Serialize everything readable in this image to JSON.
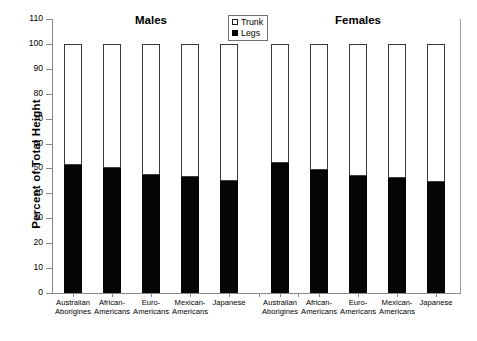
{
  "chart_data": {
    "type": "bar",
    "subtype": "stacked-percent",
    "title": "",
    "xlabel": "",
    "ylabel": "Percent of Total Height",
    "ylim": [
      0,
      110
    ],
    "ytick_step": 10,
    "yticks": [
      0,
      10,
      20,
      30,
      40,
      50,
      60,
      70,
      80,
      90,
      100,
      110
    ],
    "grid": false,
    "legend_position": "top-center",
    "legend": [
      {
        "name": "Trunk",
        "color": "#ffffff",
        "swatch": "open-square"
      },
      {
        "name": "Legs",
        "color": "#050505",
        "swatch": "filled-square"
      }
    ],
    "groups": [
      {
        "name": "Males",
        "categories": [
          "Australian Aborigines",
          "African-Americans",
          "Euro-Americans",
          "Mexican-Americans",
          "Japanese"
        ],
        "series": [
          {
            "name": "Legs",
            "values": [
              51.5,
              50.0,
              47.3,
              46.5,
              45.0
            ]
          },
          {
            "name": "Trunk",
            "values": [
              48.5,
              50.0,
              52.7,
              53.5,
              55.0
            ]
          }
        ]
      },
      {
        "name": "Females",
        "categories": [
          "Australian Aborigines",
          "African-Americans",
          "Euro-Americans",
          "Mexican-Americans",
          "Japanese"
        ],
        "series": [
          {
            "name": "Legs",
            "values": [
              52.3,
              49.3,
              47.0,
              46.3,
              44.7
            ]
          },
          {
            "name": "Trunk",
            "values": [
              47.7,
              50.7,
              53.0,
              53.7,
              55.3
            ]
          }
        ]
      }
    ],
    "category_labels_wrapped": [
      [
        "Australian",
        "Aborigines"
      ],
      [
        "African-",
        "Americans"
      ],
      [
        "Euro-",
        "Americans"
      ],
      [
        "Mexican-",
        "Americans"
      ],
      [
        "Japanese",
        ""
      ]
    ],
    "colors": {
      "legs": "#050505",
      "trunk": "#ffffff",
      "axis": "#8a8a8a",
      "bar_outline": "#3b3b3b"
    }
  },
  "axis": {
    "y_title": "Percent of Total Height",
    "y_labels": [
      "110",
      "100",
      "90",
      "80",
      "70",
      "60",
      "50",
      "40",
      "30",
      "20",
      "10",
      "0"
    ]
  },
  "groups_titles": {
    "males": "Males",
    "females": "Females"
  },
  "legend_labels": {
    "trunk": "Trunk",
    "legs": "Legs"
  }
}
